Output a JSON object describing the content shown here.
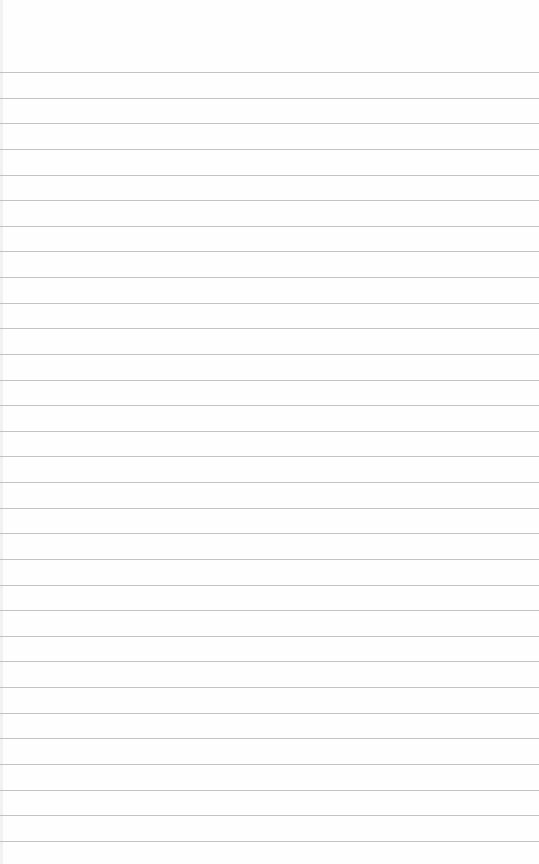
{
  "page": {
    "type": "lined-paper",
    "background_color": "#fefefe",
    "rule_color": "#b8b8b8",
    "rule_count": 31,
    "first_rule_y": 72,
    "rule_spacing": 25.63
  }
}
